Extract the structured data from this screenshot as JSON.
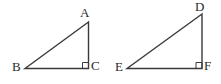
{
  "figure": {
    "kind": "geometry-diagram",
    "background_color": "#ffffff",
    "stroke_color": "#3a3a3a",
    "label_color": "#2b2b2b",
    "stroke_width": 1.4
  },
  "shapes": [
    {
      "name": "triangle-abc",
      "labels": {
        "apex": "A",
        "left": "B",
        "right": "C"
      },
      "right_angle_at": "C",
      "vertices": {
        "A": {
          "x": 88.5,
          "y": 22
        },
        "B": {
          "x": 25,
          "y": 68.5
        },
        "C": {
          "x": 88.5,
          "y": 68.5
        }
      },
      "right_angle_marker": {
        "x": 82.5,
        "y": 62.5,
        "size": 6
      },
      "label_positions": {
        "A": {
          "x": 80,
          "y": 6
        },
        "B": {
          "x": 12,
          "y": 60
        },
        "C": {
          "x": 91,
          "y": 59
        }
      }
    },
    {
      "name": "triangle-def",
      "labels": {
        "apex": "D",
        "left": "E",
        "right": "F"
      },
      "right_angle_at": "F",
      "vertices": {
        "D": {
          "x": 202,
          "y": 14
        },
        "E": {
          "x": 127,
          "y": 68.5
        },
        "F": {
          "x": 202,
          "y": 68.5
        }
      },
      "right_angle_marker": {
        "x": 196,
        "y": 62.5,
        "size": 6
      },
      "label_positions": {
        "D": {
          "x": 195,
          "y": 0
        },
        "E": {
          "x": 115,
          "y": 60
        },
        "F": {
          "x": 204,
          "y": 59
        }
      }
    }
  ]
}
